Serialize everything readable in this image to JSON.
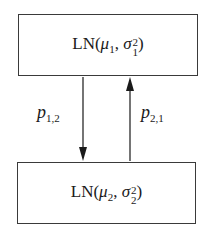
{
  "diagram": {
    "type": "state-transition",
    "states": [
      {
        "id": "state-1",
        "label": "LN(μ1, σ1²)",
        "func": "LN",
        "mean_symbol": "μ",
        "mean_index": "1",
        "var_symbol": "σ",
        "var_index": "1",
        "var_power": "2"
      },
      {
        "id": "state-2",
        "label": "LN(μ2, σ2²)",
        "func": "LN",
        "mean_symbol": "μ",
        "mean_index": "2",
        "var_symbol": "σ",
        "var_index": "2",
        "var_power": "2"
      }
    ],
    "transitions": [
      {
        "from": "state-1",
        "to": "state-2",
        "symbol": "p",
        "index": "1,2",
        "direction": "down"
      },
      {
        "from": "state-2",
        "to": "state-1",
        "symbol": "p",
        "index": "2,1",
        "direction": "up"
      }
    ],
    "colors": {
      "stroke": "#3a3a3a",
      "text": "#1a1a1a",
      "background": "#ffffff"
    }
  }
}
